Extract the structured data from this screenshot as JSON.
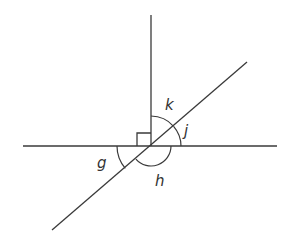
{
  "diagram": {
    "type": "angles-at-intersection",
    "right_angle_marker": true,
    "lines": [
      {
        "name": "horizontal-line",
        "x1": 23,
        "y1": 146,
        "x2": 277,
        "y2": 146
      },
      {
        "name": "vertical-ray",
        "x1": 151,
        "y1": 15,
        "x2": 151,
        "y2": 146
      },
      {
        "name": "diagonal-line",
        "x1": 52,
        "y1": 230,
        "x2": 247,
        "y2": 62
      }
    ],
    "angle_labels": {
      "k": "k",
      "j": "j",
      "g": "g",
      "h": "h"
    },
    "colors": {
      "stroke": "#3a3a3a",
      "text": "#333333",
      "background": "#ffffff"
    }
  }
}
